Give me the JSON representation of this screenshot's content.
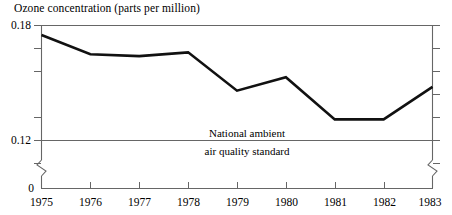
{
  "chart_data": {
    "type": "line",
    "title": "Ozone concentration (parts per million)",
    "xlabel": "",
    "ylabel": "",
    "x": [
      1975,
      1976,
      1977,
      1978,
      1979,
      1980,
      1981,
      1982,
      1983
    ],
    "categories": [
      "1975",
      "1976",
      "1977",
      "1978",
      "1979",
      "1980",
      "1981",
      "1982",
      "1983"
    ],
    "values": [
      0.175,
      0.165,
      0.164,
      0.166,
      0.146,
      0.153,
      0.131,
      0.131,
      0.148
    ],
    "series": [
      {
        "name": "Ozone concentration",
        "values": [
          0.175,
          0.165,
          0.164,
          0.166,
          0.146,
          0.153,
          0.131,
          0.131,
          0.148
        ]
      }
    ],
    "ylim": [
      0.105,
      0.18
    ],
    "xlim": [
      1975,
      1983
    ],
    "y_ticks": [
      0.18,
      0.17,
      0.16,
      0.14,
      0.12,
      0.11
    ],
    "y_tick_labels": [
      "0.18",
      "",
      "",
      "",
      "0.12",
      ""
    ],
    "y_zero_label": "0",
    "axis_break": true,
    "grid": false,
    "legend": "none",
    "reference_line": {
      "value": 0.12,
      "label_above": "National ambient",
      "label_below": "air quality standard"
    },
    "line_color": "#111111",
    "frame_color": "#555555"
  },
  "y_axis": {
    "top_label": "0.18",
    "standard_label": "0.12",
    "origin_label": "0"
  },
  "annotation": {
    "line1": "National ambient",
    "line2": "air quality standard"
  },
  "x_axis": {
    "labels": [
      "1975",
      "1976",
      "1977",
      "1978",
      "1979",
      "1980",
      "1981",
      "1982",
      "1983"
    ]
  }
}
